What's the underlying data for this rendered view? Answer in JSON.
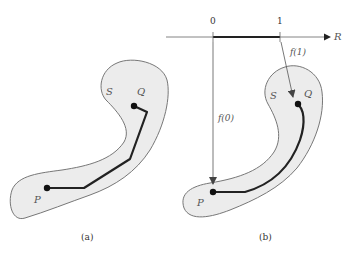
{
  "figure": {
    "panel_a": {
      "caption": "(a)",
      "region_label": "S",
      "start_point": "P",
      "end_point": "Q"
    },
    "panel_b": {
      "caption": "(b)",
      "region_label": "S",
      "start_point": "P",
      "end_point": "Q",
      "axis": {
        "label": "R",
        "tick_0": "0",
        "tick_1": "1"
      },
      "map_label_0": "f(0)",
      "map_label_1": "f(1)"
    },
    "colors": {
      "region_fill": "#ececec",
      "region_stroke": "#777777",
      "path": "#222222",
      "arrow": "#555555"
    }
  }
}
